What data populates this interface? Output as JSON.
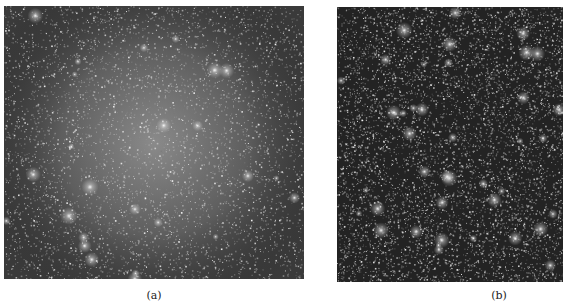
{
  "figure": {
    "panels": [
      {
        "id": "a",
        "caption": "(a)",
        "description": "Dense star field with bright diffuse central glow (globular cluster)",
        "background_color": "#3a3a3a",
        "center_glow_color": "#8a8a8a",
        "center_glow": true
      },
      {
        "id": "b",
        "caption": "(b)",
        "description": "Dense star field on dark background with scattered bright stars, no central glow",
        "background_color": "#232323",
        "center_glow": false
      }
    ]
  }
}
